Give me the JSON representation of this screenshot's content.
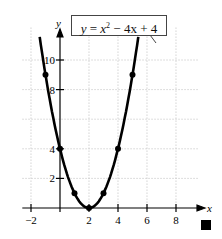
{
  "chart_data": {
    "type": "line",
    "equation_label": {
      "y": "y",
      "eq": "=",
      "x2": "x",
      "exp": "2",
      "minus": "−",
      "term2": "4x",
      "plus": "+",
      "const": "4"
    },
    "xlabel": "x",
    "ylabel": "y",
    "x_ticks": [
      "−2",
      "2",
      "4",
      "6",
      "8"
    ],
    "x_tick_values": [
      -2,
      2,
      4,
      6,
      8
    ],
    "y_ticks": [
      "2",
      "4",
      "8",
      "10"
    ],
    "y_tick_values": [
      2,
      4,
      8,
      10
    ],
    "xlim": [
      -2.5,
      9.5
    ],
    "ylim": [
      0,
      12
    ],
    "grid": true,
    "points": [
      {
        "x": -1,
        "y": 9
      },
      {
        "x": 0,
        "y": 4
      },
      {
        "x": 1,
        "y": 1
      },
      {
        "x": 2,
        "y": 0
      },
      {
        "x": 3,
        "y": 1
      },
      {
        "x": 4,
        "y": 4
      },
      {
        "x": 5,
        "y": 9
      }
    ],
    "curve_domain": [
      -1.4,
      5.4
    ]
  },
  "end_marker": "end-of-example square"
}
